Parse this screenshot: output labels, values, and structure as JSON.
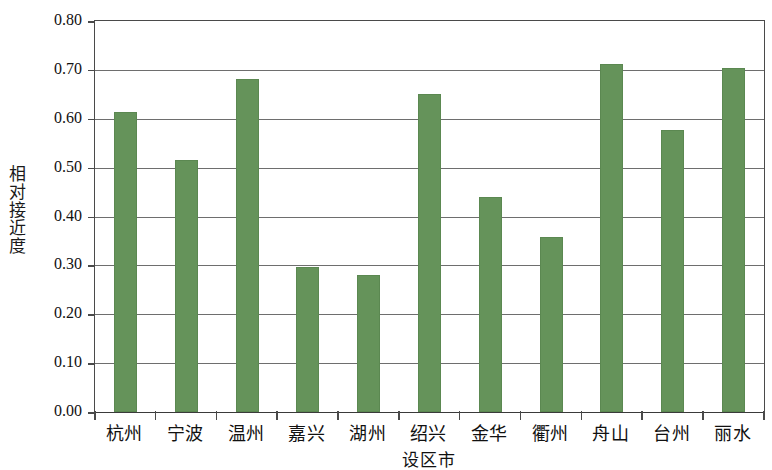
{
  "chart_data": {
    "type": "bar",
    "title": "",
    "subtitle": "",
    "xlabel": "设区市",
    "ylabel": "相对接近度",
    "categories": [
      "杭州",
      "宁波",
      "温州",
      "嘉兴",
      "湖州",
      "绍兴",
      "金华",
      "衢州",
      "舟山",
      "台州",
      "丽水"
    ],
    "values": [
      0.614,
      0.516,
      0.682,
      0.296,
      0.281,
      0.651,
      0.439,
      0.358,
      0.713,
      0.577,
      0.704
    ],
    "series": [
      {
        "name": "相对接近度",
        "values": [
          0.614,
          0.516,
          0.682,
          0.296,
          0.281,
          0.651,
          0.439,
          0.358,
          0.713,
          0.577,
          0.704
        ]
      }
    ],
    "ylim": [
      0.0,
      0.8
    ],
    "ytick_labels": [
      "0.00",
      "0.10",
      "0.20",
      "0.30",
      "0.40",
      "0.50",
      "0.60",
      "0.70",
      "0.80"
    ],
    "ytick_values": [
      0.0,
      0.1,
      0.2,
      0.3,
      0.4,
      0.5,
      0.6,
      0.7,
      0.8
    ],
    "grid": true,
    "grid_axis": "y",
    "legend": false,
    "legend_position": "none",
    "bar_color": "#65935a",
    "axis_color": "#4a4a4a",
    "gridline_color": "#6e6e6e",
    "background_color": "#ffffff",
    "annotations": []
  }
}
